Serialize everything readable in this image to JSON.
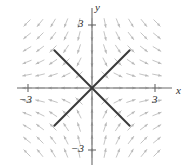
{
  "figure": {
    "kind": "direction-field",
    "width": 190,
    "height": 168,
    "background": "#ffffff"
  },
  "axes": {
    "x_label": "x",
    "y_label": "y",
    "x_label_name": "x-axis-label",
    "y_label_name": "y-axis-label",
    "axis_color": "#6b6b6b",
    "origin_px": [
      92,
      88
    ],
    "x_axis_span_px": [
      17,
      172
    ],
    "y_axis_span_px": [
      8,
      165
    ],
    "units_per_px": 13.0,
    "ticks": {
      "x": [
        {
          "value": -3,
          "label": "−3",
          "px": 28
        },
        {
          "value": 3,
          "label": "3",
          "px": 155
        }
      ],
      "y": [
        {
          "value": 3,
          "label": "3",
          "px": 25
        },
        {
          "value": -3,
          "label": "−3",
          "px": 150
        }
      ]
    }
  },
  "chart_data": {
    "type": "scatter",
    "title": "",
    "xlabel": "x",
    "ylabel": "y",
    "xlim": [
      -3.8,
      3.8
    ],
    "ylim": [
      -3.8,
      3.8
    ],
    "grid": false,
    "legend": null,
    "xticks": [
      -3,
      3
    ],
    "yticks": [
      -3,
      3
    ],
    "xticklabels": [
      "−3",
      "3"
    ],
    "yticklabels": [
      "−3",
      "3"
    ],
    "equilibrium": {
      "x": 0,
      "y": 0,
      "classification": "saddle"
    },
    "separatrices": [
      {
        "name": "unstable-separatrix",
        "slope": 1,
        "direction": "outward",
        "color": "#3a3a3a",
        "endpoints_data": [
          [
            -2.9,
            -2.9
          ],
          [
            2.9,
            2.9
          ]
        ]
      },
      {
        "name": "stable-separatrix",
        "slope": -1,
        "direction": "inward",
        "color": "#3a3a3a",
        "endpoints_data": [
          [
            -2.9,
            2.9
          ],
          [
            2.9,
            -2.9
          ]
        ]
      }
    ],
    "vector_field": {
      "color": "#b9b9b9",
      "formula_u": "x",
      "formula_v": "-y",
      "grid_spacing_px": 13,
      "grid_x_px": [
        27,
        40,
        53,
        66,
        79,
        92,
        105,
        118,
        131,
        144,
        157
      ],
      "grid_y_px": [
        23,
        36,
        49,
        62,
        75,
        88,
        101,
        114,
        127,
        140,
        153
      ],
      "arrow_length_px": 9
    }
  }
}
